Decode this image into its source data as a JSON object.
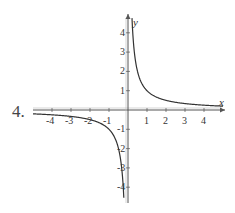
{
  "problem_number": "4.",
  "chart_data": {
    "type": "line",
    "title": "",
    "function": "y = 1/x",
    "xlabel": "x",
    "ylabel": "y",
    "xlim": [
      -5,
      5
    ],
    "ylim": [
      -4.5,
      4.7
    ],
    "x_ticks": [
      -4,
      -3,
      -2,
      -1,
      1,
      2,
      3,
      4
    ],
    "y_ticks": [
      -4,
      -3,
      -2,
      -1,
      1,
      2,
      3,
      4
    ],
    "grid": false,
    "legend": null,
    "series": [
      {
        "name": "branch-positive",
        "x": [
          0.21,
          0.25,
          0.33,
          0.5,
          0.75,
          1,
          1.5,
          2,
          3,
          4,
          5
        ],
        "values": [
          4.7,
          4,
          3,
          2,
          1.33,
          1,
          0.67,
          0.5,
          0.33,
          0.25,
          0.2
        ]
      },
      {
        "name": "branch-negative",
        "x": [
          -5,
          -4,
          -3,
          -2,
          -1.5,
          -1,
          -0.75,
          -0.5,
          -0.33,
          -0.25,
          -0.22
        ],
        "values": [
          -0.2,
          -0.25,
          -0.33,
          -0.5,
          -0.67,
          -1,
          -1.33,
          -2,
          -3,
          -4,
          -4.5
        ]
      }
    ],
    "colors": {
      "axis": "#555555",
      "curve": "#333333"
    }
  }
}
